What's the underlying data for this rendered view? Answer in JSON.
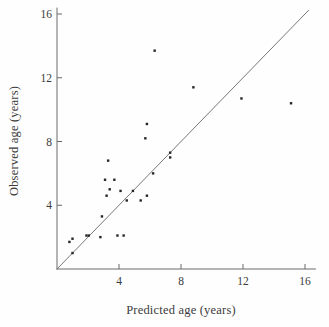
{
  "chart_data": {
    "type": "scatter",
    "title": "",
    "xlabel": "Predicted age (years)",
    "ylabel": "Observed age (years)",
    "xlim": [
      0,
      16.7
    ],
    "ylim": [
      0,
      16.4
    ],
    "xticks": [
      4,
      8,
      12,
      16
    ],
    "yticks": [
      4,
      8,
      12,
      16
    ],
    "grid": false,
    "legend": "none",
    "marker_shape": "small-square",
    "marker_color": "#262626",
    "axis_color": "#6a6a6a",
    "tick_label_color": "#3b3b3b",
    "identity_line": {
      "x": [
        0,
        16.25
      ],
      "y": [
        0,
        16.25
      ],
      "color": "#787878"
    },
    "points": [
      [
        0.8,
        1.7
      ],
      [
        1.0,
        1.9
      ],
      [
        1.0,
        1.0
      ],
      [
        1.9,
        2.1
      ],
      [
        2.05,
        2.1
      ],
      [
        2.8,
        2.0
      ],
      [
        2.9,
        3.3
      ],
      [
        3.2,
        4.6
      ],
      [
        3.1,
        5.6
      ],
      [
        3.3,
        6.8
      ],
      [
        3.4,
        5.0
      ],
      [
        3.7,
        5.6
      ],
      [
        3.9,
        2.1
      ],
      [
        4.1,
        4.9
      ],
      [
        4.3,
        2.1
      ],
      [
        4.5,
        4.3
      ],
      [
        4.9,
        4.9
      ],
      [
        5.4,
        4.3
      ],
      [
        5.8,
        4.6
      ],
      [
        5.7,
        8.2
      ],
      [
        5.8,
        9.1
      ],
      [
        6.2,
        6.0
      ],
      [
        6.3,
        13.7
      ],
      [
        7.3,
        7.0
      ],
      [
        7.3,
        7.3
      ],
      [
        8.8,
        11.4
      ],
      [
        11.9,
        10.7
      ],
      [
        15.1,
        10.4
      ]
    ]
  }
}
